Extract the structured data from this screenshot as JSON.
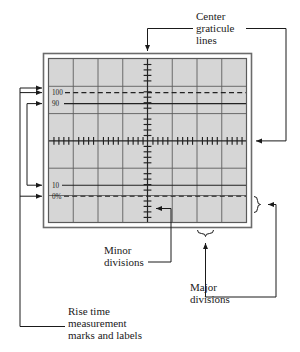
{
  "figure": {
    "kind": "oscilloscope-graticule-diagram",
    "background_color": "#ffffff",
    "screen_fill": "#d6d6d6",
    "line_color": "#4a4a4a",
    "ink_color": "#1a1a1a"
  },
  "graticule": {
    "major_divisions_horizontal": 8,
    "major_divisions_vertical": 6,
    "minor_divisions_per_major": 5,
    "center_vertical_line": true,
    "center_horizontal_line": true,
    "frame_style": "double-rule"
  },
  "rise_time_marks": [
    {
      "label": "100",
      "line_style": "dashed"
    },
    {
      "label": "90",
      "line_style": "solid"
    },
    {
      "label": "10",
      "line_style": "solid"
    },
    {
      "label": "0%",
      "line_style": "dashed"
    }
  ],
  "callouts": {
    "center_graticule": {
      "lines": [
        "Center",
        "graticule",
        "lines"
      ]
    },
    "minor_divisions": {
      "lines": [
        "Minor",
        "divisions"
      ]
    },
    "major_divisions": {
      "lines": [
        "Major",
        "divisions"
      ]
    },
    "rise_time": {
      "lines": [
        "Rise time",
        "measurement",
        "marks and labels"
      ]
    }
  }
}
